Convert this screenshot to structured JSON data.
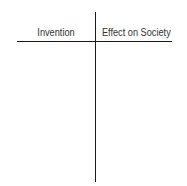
{
  "t_chart": {
    "columns": [
      {
        "header": "Invention",
        "rows": []
      },
      {
        "header": "Effect on Society",
        "rows": []
      }
    ],
    "line_color": "#1a1a1a",
    "text_color": "#333333"
  }
}
